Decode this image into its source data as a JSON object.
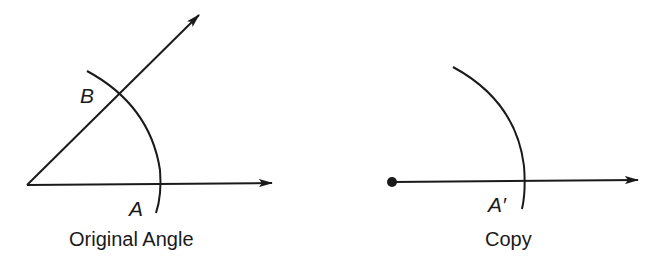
{
  "figures": [
    {
      "caption": "Original Angle",
      "points": {
        "B": "B",
        "A": "A"
      }
    },
    {
      "caption": "Copy",
      "points": {
        "A_prime": "A′"
      }
    }
  ],
  "colors": {
    "stroke": "#1a1a1a",
    "background": "#ffffff"
  }
}
